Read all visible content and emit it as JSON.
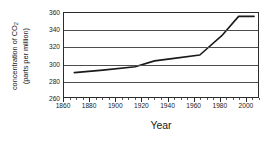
{
  "chart_data": {
    "type": "line",
    "title": "",
    "xlabel": "Year",
    "ylabel": "concentration of CO2 (parts per million)",
    "ylabel_line1": "concentration of CO",
    "ylabel_sub": "2",
    "ylabel_line2": "(parts per million)",
    "xlim": [
      1860,
      2010
    ],
    "ylim": [
      260,
      360
    ],
    "xticks": [
      1860,
      1880,
      1900,
      1920,
      1940,
      1960,
      1980,
      2000
    ],
    "xtick_labels": [
      "1860",
      "1880",
      "1900",
      "1920",
      "1940",
      "1960",
      "1980",
      "2000"
    ],
    "xminor_step": 5,
    "yticks": [
      260,
      280,
      300,
      320,
      340,
      360
    ],
    "ytick_labels": [
      "260",
      "280",
      "300",
      "320",
      "340",
      "360"
    ],
    "grid": true,
    "grid_axis": "y",
    "legend": "none",
    "line_color": "#1a1a1a",
    "line_width": 1.6,
    "series": [
      {
        "name": "CO2 concentration",
        "x": [
          1868,
          1890,
          1915,
          1930,
          1945,
          1965,
          1982,
          1995,
          2007
        ],
        "values": [
          289,
          292,
          296,
          303,
          306,
          310,
          333,
          356,
          356
        ]
      }
    ]
  },
  "colors": {
    "axis": "#2b2b2b",
    "grid": "#4d4d4d",
    "text": "#1a1a1a",
    "background": "#ffffff"
  }
}
